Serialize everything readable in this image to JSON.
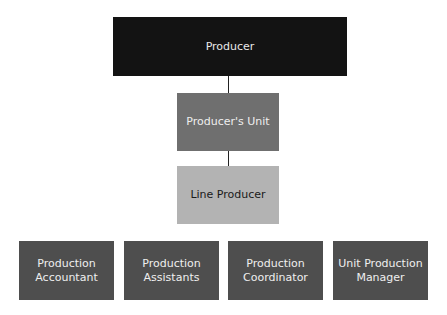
{
  "chart": {
    "top": {
      "label": "Producer"
    },
    "level2": {
      "label": "Producer's Unit"
    },
    "level3": {
      "label": "Line Producer"
    },
    "bottom": [
      {
        "line1": "Production",
        "line2": "Accountant"
      },
      {
        "line1": "Production",
        "line2": "Assistants"
      },
      {
        "line1": "Production",
        "line2": "Coordinator"
      },
      {
        "line1": "Unit Production",
        "line2": "Manager"
      }
    ]
  },
  "colors": {
    "top": "#131313",
    "level2": "#6f6f6f",
    "level3": "#b3b3b3",
    "bottom": "#4e4e4e"
  }
}
